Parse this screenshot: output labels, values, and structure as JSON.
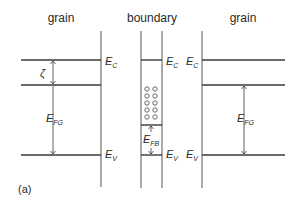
{
  "diagram": {
    "panel_label": "(a)",
    "regions": [
      {
        "title": "grain",
        "id": "left-grain"
      },
      {
        "title": "boundary",
        "id": "boundary"
      },
      {
        "title": "grain",
        "id": "right-grain"
      }
    ],
    "labels": {
      "E": "E",
      "sub_C": "C",
      "sub_V": "V",
      "sub_FG": "FG",
      "sub_FB": "FB",
      "zeta": "ζ"
    },
    "left_grain": {
      "band_labels": [
        "E_C",
        "E_V"
      ],
      "arrows": [
        "ζ",
        "E_FG"
      ]
    },
    "boundary": {
      "band_labels": [
        "E_C",
        "E_V"
      ],
      "arrows": [
        "E_FB"
      ],
      "trap_states": {
        "rows": 5,
        "columns": 2,
        "symbol": "circle"
      }
    },
    "right_grain": {
      "band_labels": [
        "E_C",
        "E_V"
      ],
      "arrows": [
        "E_FG"
      ]
    }
  }
}
